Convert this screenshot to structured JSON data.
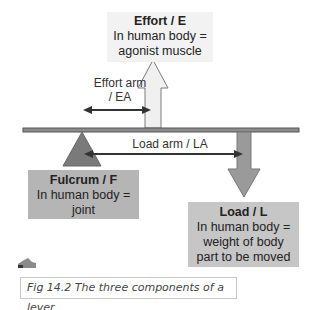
{
  "diagram": {
    "effort": {
      "title": "Effort / E",
      "lines": [
        "In human body =",
        "agonist muscle"
      ]
    },
    "fulcrum": {
      "title": "Fulcrum / F",
      "lines": [
        "In human body =",
        "joint"
      ]
    },
    "load": {
      "title": "Load / L",
      "lines": [
        "In human body =",
        "weight of body",
        "part to be moved"
      ]
    },
    "effort_arm_label": [
      "Effort arm",
      "/ EA"
    ],
    "load_arm_label": "Load arm / LA",
    "caption": "Fig 14.2 The three components of a lever",
    "colors": {
      "beam": "#555555",
      "effort_arrow_fill": "#f0f0f0",
      "load_arrow_fill": "#9a9a9a",
      "fulcrum_fill": "#7a7a7a",
      "arm_arrow": "#333333"
    }
  }
}
